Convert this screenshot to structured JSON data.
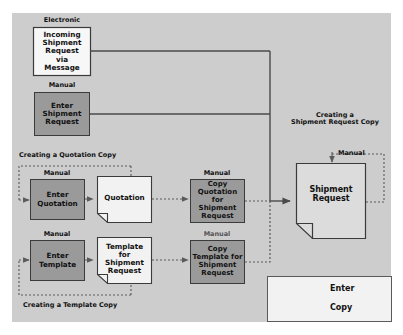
{
  "diagram": {
    "title_hidden": "",
    "nodes": {
      "incoming": {
        "label": "Incoming\nShipment\nRequest\nvia\nMessage",
        "caption": "Electronic",
        "type": "document"
      },
      "enter_shipment": {
        "label": "Enter\nShipment\nRequest",
        "caption": "Manual",
        "type": "manual"
      },
      "enter_quotation": {
        "label": "Enter\nQuotation",
        "caption": "Manual",
        "type": "manual"
      },
      "quotation_doc": {
        "label": "Quotation",
        "caption": "",
        "type": "document"
      },
      "copy_quotation": {
        "label": "Copy\nQuotation for\nShipment\nRequest",
        "caption": "Manual",
        "type": "manual"
      },
      "enter_template": {
        "label": "Enter\nTemplate",
        "caption": "Manual",
        "type": "manual"
      },
      "template_doc": {
        "label": "Template\nfor\nShipment\nRequest",
        "caption": "",
        "type": "document"
      },
      "copy_template": {
        "label": "Copy\nTemplate for\nShipment\nRequest",
        "caption": "Manual",
        "type": "manual"
      },
      "shipment_request": {
        "label": "Shipment\nRequest",
        "caption": "Manual",
        "type": "document"
      }
    },
    "groups": {
      "quotation_copy": "Creating a Quotation Copy",
      "template_copy": "Creating a Template Copy",
      "shipment_copy": "Creating a\nShipment Request Copy"
    },
    "legend": {
      "items": [
        {
          "name": "enter",
          "label": "Enter",
          "style": "solid"
        },
        {
          "name": "copy",
          "label": "Copy",
          "style": "dotted"
        }
      ]
    },
    "colors": {
      "panel": "#cdcdcd",
      "manual_fill": "#9a9a9a",
      "document_fill": "#f2f2f2",
      "stroke": "#3b3b3b",
      "line": "#4a4a4a"
    }
  }
}
